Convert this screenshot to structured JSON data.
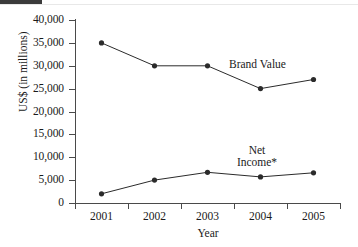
{
  "chart_data": {
    "type": "line",
    "title": "",
    "xlabel": "Year",
    "ylabel": "US$ (in millions)",
    "x": [
      "2001",
      "2002",
      "2003",
      "2004",
      "2005"
    ],
    "categories": [
      "2001",
      "2002",
      "2003",
      "2004",
      "2005"
    ],
    "ylim": [
      0,
      40000
    ],
    "ytick_labels": [
      "40,000",
      "35,000",
      "30,000",
      "25,000",
      "20,000",
      "15,000",
      "10,000",
      "5,000",
      "0"
    ],
    "ytick_values": [
      40000,
      35000,
      30000,
      25000,
      20000,
      15000,
      10000,
      5000,
      0
    ],
    "grid": false,
    "legend_position": "inline-annotations",
    "series": [
      {
        "name": "Brand Value",
        "label": "Brand Value",
        "values": [
          35000,
          30000,
          30000,
          25000,
          27000
        ],
        "color": "#2b2b2b",
        "marker": "filled-circle"
      },
      {
        "name": "Net Income*",
        "label": "Net\nIncome*",
        "values": [
          2000,
          5000,
          6700,
          5700,
          6600
        ],
        "color": "#2b2b2b",
        "marker": "filled-circle"
      }
    ],
    "annotations": [
      {
        "text": "Brand Value",
        "series": "Brand Value"
      },
      {
        "text": "Net\nIncome*",
        "series": "Net Income*"
      }
    ]
  },
  "axis": {
    "y_title": "US$ (in millions)",
    "x_title": "Year",
    "y_ticks": [
      {
        "label": "40,000",
        "value": 40000
      },
      {
        "label": "35,000",
        "value": 35000
      },
      {
        "label": "30,000",
        "value": 30000
      },
      {
        "label": "25,000",
        "value": 25000
      },
      {
        "label": "20,000",
        "value": 20000
      },
      {
        "label": "15,000",
        "value": 15000
      },
      {
        "label": "10,000",
        "value": 10000
      },
      {
        "label": "5,000",
        "value": 5000
      },
      {
        "label": "0",
        "value": 0
      }
    ],
    "x_ticks": [
      {
        "label": "2001"
      },
      {
        "label": "2002"
      },
      {
        "label": "2003"
      },
      {
        "label": "2004"
      },
      {
        "label": "2005"
      }
    ]
  },
  "colors": {
    "line": "#2b2b2b",
    "axis": "#4a4a4a",
    "text": "#1a1a1a",
    "background": "#ffffff"
  }
}
